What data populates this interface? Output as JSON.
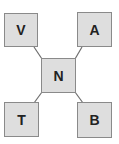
{
  "diagram": {
    "type": "star",
    "center": {
      "id": "N",
      "label": "N"
    },
    "nodes": [
      {
        "id": "V",
        "label": "V",
        "position": "top-left"
      },
      {
        "id": "A",
        "label": "A",
        "position": "top-right"
      },
      {
        "id": "T",
        "label": "T",
        "position": "bottom-left"
      },
      {
        "id": "B",
        "label": "B",
        "position": "bottom-right"
      }
    ],
    "edges": [
      {
        "from": "N",
        "to": "V"
      },
      {
        "from": "N",
        "to": "A"
      },
      {
        "from": "N",
        "to": "T"
      },
      {
        "from": "N",
        "to": "B"
      }
    ],
    "colors": {
      "node_fill": "#dedede",
      "node_border": "#8a8a8a",
      "edge": "#6e6e6e",
      "text": "#222222"
    }
  }
}
